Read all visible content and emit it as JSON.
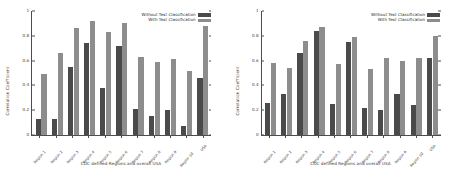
{
  "figure": {
    "panel_count": 2
  },
  "chart_data": [
    {
      "type": "bar",
      "title": "",
      "xlabel": "CDC defined Regions and overall USA",
      "ylabel": "Correlation Coefficient",
      "ylim": [
        0,
        1
      ],
      "yticks": [
        "0",
        "0.2",
        "0.4",
        "0.6",
        "0.8",
        "1"
      ],
      "ytick_values": [
        0,
        0.2,
        0.4,
        0.6,
        0.8,
        1
      ],
      "grid": false,
      "legend_position": "upper right",
      "categories": [
        "Region 1",
        "Region 2",
        "Region 3",
        "Region 4",
        "Region 5",
        "Region 6",
        "Region 7",
        "Region 8",
        "Region 9",
        "Region 10",
        "USA"
      ],
      "series": [
        {
          "name": "Without Text Classification",
          "color": "#4a4a4a",
          "values": [
            0.13,
            0.13,
            0.55,
            0.74,
            0.38,
            0.72,
            0.21,
            0.15,
            0.2,
            0.07,
            0.46
          ]
        },
        {
          "name": "With Text Classification",
          "color": "#8d8d8d",
          "values": [
            0.49,
            0.66,
            0.86,
            0.92,
            0.83,
            0.9,
            0.63,
            0.59,
            0.61,
            0.52,
            0.88
          ]
        }
      ]
    },
    {
      "type": "bar",
      "title": "",
      "xlabel": "CDC defined Regions and overall USA",
      "ylabel": "Correlation Coefficient",
      "ylim": [
        0,
        1
      ],
      "yticks": [
        "0",
        "0.2",
        "0.4",
        "0.6",
        "0.8",
        "1"
      ],
      "ytick_values": [
        0,
        0.2,
        0.4,
        0.6,
        0.8,
        1
      ],
      "grid": false,
      "legend_position": "upper right",
      "categories": [
        "Region 1",
        "Region 2",
        "Region 3",
        "Region 4",
        "Region 5",
        "Region 6",
        "Region 7",
        "Region 8",
        "Region 9",
        "Region 10",
        "USA"
      ],
      "series": [
        {
          "name": "Without Text Classification",
          "color": "#4a4a4a",
          "values": [
            0.26,
            0.33,
            0.66,
            0.84,
            0.25,
            0.75,
            0.22,
            0.2,
            0.33,
            0.24,
            0.62
          ]
        },
        {
          "name": "With Text Classification",
          "color": "#8d8d8d",
          "values": [
            0.58,
            0.54,
            0.76,
            0.87,
            0.57,
            0.79,
            0.53,
            0.62,
            0.6,
            0.62,
            0.8
          ]
        }
      ]
    }
  ]
}
